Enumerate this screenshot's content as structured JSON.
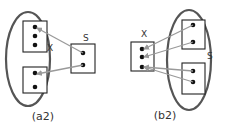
{
  "colors": {
    "ellipse_stroke": "#555555",
    "box_stroke": "#222222",
    "dot": "#111111",
    "arrow": "#9a9a9a",
    "text": "#333333",
    "background": "#ffffff"
  },
  "panels": [
    {
      "id": "a2",
      "caption": "(a2)",
      "ellipse_group_label": "X",
      "single_box_label": "S",
      "ellipse": {
        "cx": 28,
        "cy": 59,
        "rx": 22,
        "ry": 47
      },
      "grouped_boxes": [
        {
          "x": 23,
          "y": 21,
          "w": 24,
          "h": 31,
          "dots": [
            [
              35,
              27
            ],
            [
              35,
              36
            ],
            [
              35,
              45
            ]
          ]
        },
        {
          "x": 23,
          "y": 67,
          "w": 24,
          "h": 26,
          "dots": [
            [
              35,
              73
            ],
            [
              35,
              87
            ]
          ]
        }
      ],
      "single_box": {
        "x": 71,
        "y": 44,
        "w": 24,
        "h": 29,
        "dots": [
          [
            83,
            53
          ],
          [
            83,
            65
          ]
        ]
      },
      "arrows": [
        {
          "from": [
            83,
            53
          ],
          "to": [
            37,
            28
          ]
        },
        {
          "from": [
            83,
            65
          ],
          "to": [
            37,
            74
          ]
        }
      ],
      "label_positions": {
        "group": [
          47,
          51
        ],
        "single": [
          83,
          41
        ],
        "caption": [
          43,
          120
        ]
      }
    },
    {
      "id": "b2",
      "caption": "(b2)",
      "ellipse_group_label": "S",
      "single_box_label": "X",
      "ellipse": {
        "cx": 189,
        "cy": 60,
        "rx": 22,
        "ry": 50
      },
      "grouped_boxes": [
        {
          "x": 182,
          "y": 20,
          "w": 23,
          "h": 29,
          "dots": [
            [
              193,
              25
            ],
            [
              193,
              42
            ]
          ]
        },
        {
          "x": 182,
          "y": 63,
          "w": 23,
          "h": 31,
          "dots": [
            [
              193,
              71
            ],
            [
              193,
              82
            ]
          ]
        }
      ],
      "single_box": {
        "x": 131,
        "y": 42,
        "w": 23,
        "h": 29,
        "dots": [
          [
            142,
            49
          ],
          [
            142,
            57
          ],
          [
            142,
            67
          ]
        ]
      },
      "arrows": [
        {
          "from": [
            193,
            25
          ],
          "to": [
            144,
            49
          ]
        },
        {
          "from": [
            193,
            42
          ],
          "to": [
            144,
            57
          ]
        },
        {
          "from": [
            193,
            71
          ],
          "to": [
            144,
            67
          ]
        },
        {
          "from": [
            193,
            82
          ],
          "to": [
            144,
            67
          ]
        }
      ],
      "label_positions": {
        "group": [
          207,
          59
        ],
        "single": [
          141,
          37
        ],
        "caption": [
          165,
          119
        ]
      }
    }
  ]
}
